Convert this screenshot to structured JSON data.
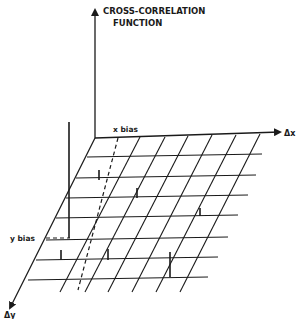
{
  "title_line1": "CROSS-CORRELATION",
  "title_line2": "FUNCTION",
  "axes": {
    "x_label": "Δx",
    "y_label": "Δy"
  },
  "annotations": {
    "x_bias": "x bias",
    "y_bias": "y bias"
  },
  "colors": {
    "ink": "#1a1a1a",
    "background": "#ffffff"
  }
}
